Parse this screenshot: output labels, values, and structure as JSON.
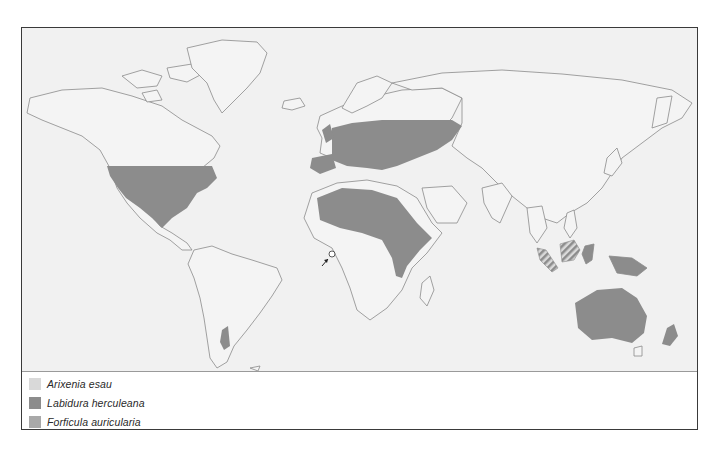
{
  "map": {
    "type": "distribution-map",
    "subject": "Earwig species distribution",
    "colors": {
      "ocean": "#f1f1f1",
      "land": "#f4f4f4",
      "coastline": "#8a8a8a",
      "frame": "#3a3a3a"
    },
    "marker": {
      "icon": "circle-with-arrow",
      "label_hint": "small island in South Atlantic"
    }
  },
  "legend": {
    "items": [
      {
        "label": "Arixenia esau",
        "color": "#d9d9d9"
      },
      {
        "label": "Labidura herculeana",
        "color": "#8c8c8c"
      },
      {
        "label": "Forficula auricularia",
        "color": "#a9a9a9"
      }
    ]
  }
}
